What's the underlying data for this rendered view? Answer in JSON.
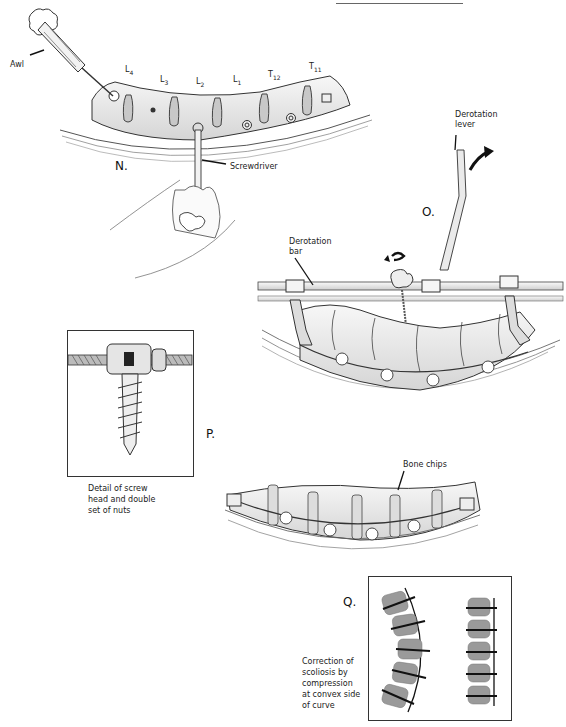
{
  "figure": {
    "top_rule": true,
    "panels": [
      {
        "id": "N",
        "label": "N."
      },
      {
        "id": "O",
        "label": "O."
      },
      {
        "id": "P",
        "label": "P."
      },
      {
        "id": "Q",
        "label": "Q."
      }
    ]
  },
  "panel_n": {
    "label": "N.",
    "vertebra_labels": [
      {
        "base": "L",
        "sub": "4"
      },
      {
        "base": "L",
        "sub": "3"
      },
      {
        "base": "L",
        "sub": "2"
      },
      {
        "base": "L",
        "sub": "1"
      },
      {
        "base": "T",
        "sub": "12"
      },
      {
        "base": "T",
        "sub": "11"
      }
    ],
    "callouts": {
      "awl": "Awl",
      "screwdriver": "Screwdriver"
    }
  },
  "panel_o": {
    "label": "O.",
    "callouts": {
      "derotation_lever_line1": "Derotation",
      "derotation_lever_line2": "lever",
      "derotation_bar_line1": "Derotation",
      "derotation_bar_line2": "bar"
    }
  },
  "panel_p": {
    "label": "P.",
    "detail_caption": [
      "Detail of screw",
      "head and double",
      "set of nuts"
    ],
    "callouts": {
      "bone_chips": "Bone chips"
    }
  },
  "panel_q": {
    "label": "Q.",
    "caption": [
      "Correction of",
      "scoliosis by",
      "compression",
      "at convex side",
      "of curve"
    ]
  },
  "colors": {
    "ink": "#1a1a1a",
    "bone_fill": "#e9e9e9",
    "shade": "#b5b5b5",
    "block_fill": "#9a9a9a"
  }
}
